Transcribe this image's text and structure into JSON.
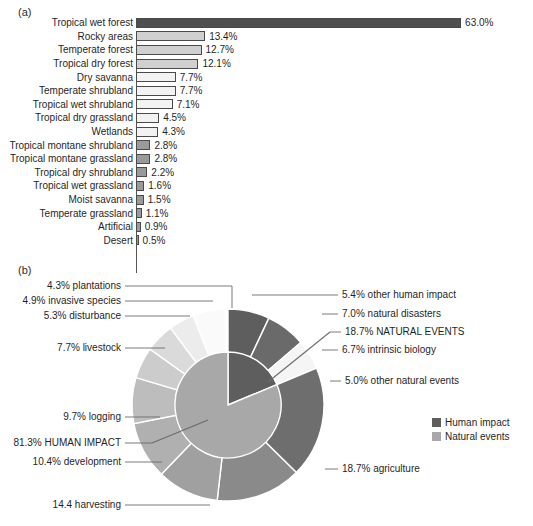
{
  "panels": {
    "a_letter": "(a)",
    "b_letter": "(b)"
  },
  "colors": {
    "bar_dark": "#4f4f4f",
    "bar_light": "#d0d0d0",
    "bar_pale": "#f2f2f2",
    "bar_medium": "#9a9a9a",
    "bar_stroke": "#4a4a4a",
    "human_impact": "#a8a8a8",
    "natural_events": "#5e5e5e",
    "pie_stroke": "#ffffff",
    "leader_line": "#6b6b6b",
    "text": "#1f1f1f"
  },
  "chart_data": [
    {
      "type": "bar",
      "title": "",
      "orientation": "horizontal",
      "xlabel": "",
      "ylabel": "",
      "xlim": [
        0,
        63
      ],
      "grid": false,
      "value_suffix": "%",
      "categories": [
        "Tropical wet forest",
        "Rocky areas",
        "Temperate forest",
        "Tropical dry forest",
        "Dry savanna",
        "Temperate shrubland",
        "Tropical wet shrubland",
        "Tropical dry grassland",
        "Wetlands",
        "Tropical montane shrubland",
        "Tropical montane grassland",
        "Tropical dry shrubland",
        "Tropical wet grassland",
        "Moist savanna",
        "Temperate grassland",
        "Artificial",
        "Desert"
      ],
      "values": [
        63.0,
        13.4,
        12.7,
        12.1,
        7.7,
        7.7,
        7.1,
        4.5,
        4.3,
        2.8,
        2.8,
        2.2,
        1.6,
        1.5,
        1.1,
        0.9,
        0.5
      ],
      "value_labels": [
        "63.0%",
        "13.4%",
        "12.7%",
        "12.1%",
        "7.7%",
        "7.7%",
        "7.1%",
        "4.5%",
        "4.3%",
        "2.8%",
        "2.8%",
        "2.2%",
        "1.6%",
        "1.5%",
        "1.1%",
        "0.9%",
        "0.5%"
      ],
      "bar_fills": [
        "#4f4f4f",
        "#d0d0d0",
        "#d0d0d0",
        "#d0d0d0",
        "#f2f2f2",
        "#f2f2f2",
        "#f2f2f2",
        "#f2f2f2",
        "#f2f2f2",
        "#9a9a9a",
        "#9a9a9a",
        "#9a9a9a",
        "#9a9a9a",
        "#9a9a9a",
        "#9a9a9a",
        "#9a9a9a",
        "#9a9a9a"
      ]
    },
    {
      "type": "pie",
      "variant": "nested-donut",
      "title": "",
      "inner_ring": {
        "name": "Cause category",
        "labels": [
          "HUMAN IMPACT",
          "NATURAL EVENTS"
        ],
        "values": [
          81.3,
          18.7
        ],
        "value_labels": [
          "81.3% HUMAN IMPACT",
          "18.7% NATURAL EVENTS"
        ],
        "colors": [
          "#a8a8a8",
          "#5e5e5e"
        ]
      },
      "outer_ring": {
        "name": "Specific cause",
        "labels": [
          "agriculture",
          "harvesting",
          "development",
          "logging",
          "livestock",
          "disturbance",
          "invasive species",
          "plantations",
          "other human impact",
          "natural disasters",
          "intrinsic biology",
          "other natural events"
        ],
        "values": [
          18.7,
          14.4,
          10.4,
          9.7,
          7.7,
          5.3,
          4.9,
          4.3,
          5.4,
          7.0,
          6.7,
          5.0
        ],
        "value_labels": [
          "18.7% agriculture",
          "14.4 harvesting",
          "10.4% development",
          "9.7% logging",
          "7.7% livestock",
          "5.3% disturbance",
          "4.9% invasive species",
          "4.3% plantations",
          "5.4% other human impact",
          "7.0% natural disasters",
          "6.7% intrinsic biology",
          "5.0% other natural events"
        ],
        "colors": [
          "#6e6e6e",
          "#8a8a8a",
          "#a0a0a0",
          "#b0b0b0",
          "#bdbdbd",
          "#cccccc",
          "#dadada",
          "#ececec",
          "#fafafa",
          "#5e5e5e",
          "#6a6a6a",
          "#f5f5f5"
        ],
        "group_of": [
          "human",
          "human",
          "human",
          "human",
          "human",
          "human",
          "human",
          "human",
          "human",
          "natural",
          "natural",
          "natural"
        ]
      },
      "legend": {
        "position": "right",
        "entries": [
          {
            "label": "Human impact",
            "color": "#5e5e5e"
          },
          {
            "label": "Natural events",
            "color": "#a8a8a8"
          }
        ]
      }
    }
  ]
}
